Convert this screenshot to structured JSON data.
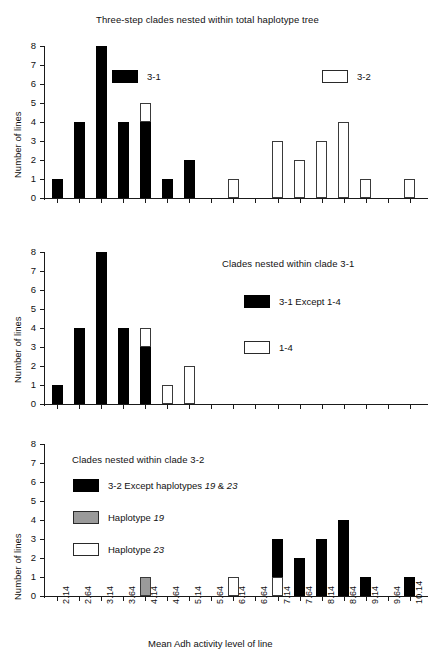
{
  "figure": {
    "xlabel": "Mean Adh activity level of line",
    "ylabel": "Number of lines",
    "categories": [
      "2.14",
      "2.64",
      "3.14",
      "3.64",
      "4.14",
      "4.64",
      "5.14",
      "5.64",
      "6.14",
      "6.64",
      "7.14",
      "7.64",
      "8.14",
      "8.64",
      "9.14",
      "9.64",
      "10.14"
    ],
    "yticks": [
      "0",
      "1",
      "2",
      "3",
      "4",
      "5",
      "6",
      "7",
      "8"
    ],
    "ylim": [
      0,
      8
    ],
    "colors": {
      "black": "#000000",
      "white": "#ffffff",
      "gray": "#9a9a9a",
      "axis": "#1a1a1a"
    }
  },
  "panels": [
    {
      "id": "panel-1",
      "title": "Three-step clades nested within total haplotype tree",
      "legend": [
        {
          "id": "legend-3-1",
          "swatch": "black",
          "label": "3-1"
        },
        {
          "id": "legend-3-2",
          "swatch": "white",
          "label": "3-2"
        }
      ]
    },
    {
      "id": "panel-2",
      "title": "Clades nested within clade 3-1",
      "legend": [
        {
          "id": "legend-3-1-except-1-4",
          "swatch": "black",
          "label": "3-1 Except 1-4"
        },
        {
          "id": "legend-1-4",
          "swatch": "white",
          "label": "1-4"
        }
      ]
    },
    {
      "id": "panel-3",
      "title": "Clades nested within clade 3-2",
      "legend": [
        {
          "id": "legend-3-2-except",
          "swatch": "black",
          "label_pre": "3-2 Except haplotypes ",
          "label_em1": "19",
          "label_mid": " & ",
          "label_em2": "23"
        },
        {
          "id": "legend-haplotype-19",
          "swatch": "gray",
          "label_pre": "Haplotype ",
          "label_em1": "19"
        },
        {
          "id": "legend-haplotype-23",
          "swatch": "white",
          "label_pre": "Haplotype ",
          "label_em1": "23"
        }
      ]
    }
  ],
  "chart_data": [
    {
      "type": "bar",
      "title": "Three-step clades nested within total haplotype tree",
      "xlabel": "Mean Adh activity level of line",
      "ylabel": "Number of lines",
      "ylim": [
        0,
        8
      ],
      "grid": false,
      "legend_position": "inside-top",
      "stacked": true,
      "categories": [
        "2.14",
        "2.64",
        "3.14",
        "3.64",
        "4.14",
        "4.64",
        "5.14",
        "5.64",
        "6.14",
        "6.64",
        "7.14",
        "7.64",
        "8.14",
        "8.64",
        "9.14",
        "9.64",
        "10.14"
      ],
      "series": [
        {
          "name": "3-1",
          "fill": "black",
          "values": [
            1,
            4,
            8,
            4,
            4,
            1,
            2,
            0,
            0,
            0,
            0,
            0,
            0,
            0,
            0,
            0,
            0
          ]
        },
        {
          "name": "3-2",
          "fill": "white",
          "values": [
            0,
            0,
            0,
            0,
            1,
            0,
            0,
            0,
            1,
            0,
            3,
            2,
            3,
            4,
            1,
            0,
            1
          ]
        }
      ]
    },
    {
      "type": "bar",
      "title": "Clades nested within clade 3-1",
      "xlabel": "Mean Adh activity level of line",
      "ylabel": "Number of lines",
      "ylim": [
        0,
        8
      ],
      "grid": false,
      "legend_position": "inside-right",
      "stacked": true,
      "categories": [
        "2.14",
        "2.64",
        "3.14",
        "3.64",
        "4.14",
        "4.64",
        "5.14",
        "5.64",
        "6.14",
        "6.64",
        "7.14",
        "7.64",
        "8.14",
        "8.64",
        "9.14",
        "9.64",
        "10.14"
      ],
      "series": [
        {
          "name": "3-1 Except 1-4",
          "fill": "black",
          "values": [
            1,
            4,
            8,
            4,
            3,
            0,
            0,
            0,
            0,
            0,
            0,
            0,
            0,
            0,
            0,
            0,
            0
          ]
        },
        {
          "name": "1-4",
          "fill": "white",
          "values": [
            0,
            0,
            0,
            0,
            1,
            1,
            2,
            0,
            0,
            0,
            0,
            0,
            0,
            0,
            0,
            0,
            0
          ]
        }
      ]
    },
    {
      "type": "bar",
      "title": "Clades nested within clade 3-2",
      "xlabel": "Mean Adh activity level of line",
      "ylabel": "Number of lines",
      "ylim": [
        0,
        8
      ],
      "grid": false,
      "legend_position": "inside-left",
      "stacked": true,
      "categories": [
        "2.14",
        "2.64",
        "3.14",
        "3.64",
        "4.14",
        "4.64",
        "5.14",
        "5.64",
        "6.14",
        "6.64",
        "7.14",
        "7.64",
        "8.14",
        "8.64",
        "9.14",
        "9.64",
        "10.14"
      ],
      "series": [
        {
          "name": "Haplotype 19",
          "fill": "gray",
          "values": [
            0,
            0,
            0,
            0,
            1,
            0,
            0,
            0,
            0,
            0,
            0,
            0,
            0,
            0,
            0,
            0,
            0
          ]
        },
        {
          "name": "Haplotype 23",
          "fill": "white",
          "values": [
            0,
            0,
            0,
            0,
            0,
            0,
            0,
            0,
            1,
            0,
            1,
            0,
            0,
            0,
            0,
            0,
            0
          ]
        },
        {
          "name": "3-2 Except haplotypes 19 & 23",
          "fill": "black",
          "values": [
            0,
            0,
            0,
            0,
            0,
            0,
            0,
            0,
            0,
            0,
            2,
            2,
            3,
            4,
            1,
            0,
            1
          ]
        }
      ]
    }
  ]
}
